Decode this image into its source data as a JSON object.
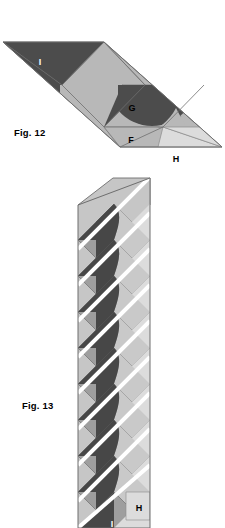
{
  "page": {
    "width": 225,
    "height": 528,
    "background": "#ffffff",
    "type": "geometric-figure-plate"
  },
  "figures": [
    {
      "id": "fig-12",
      "caption": "Fig. 12",
      "caption_position": {
        "x": 14,
        "y": 127
      },
      "description": "Flattened oblique band strip composed of triangular and lens-shaped tiles",
      "piece_labels": [
        {
          "text": "I",
          "x": 40,
          "y": 65,
          "tone": "dark"
        },
        {
          "text": "G",
          "x": 132,
          "y": 111,
          "tone": "light"
        },
        {
          "text": "F",
          "x": 131,
          "y": 143,
          "tone": "light"
        },
        {
          "text": "H",
          "x": 176,
          "y": 162,
          "tone": "light"
        }
      ]
    },
    {
      "id": "fig-13",
      "caption": "Fig. 13",
      "caption_position": {
        "x": 22,
        "y": 400
      },
      "description": "Vertical folded strip with repeating diagonal bands and S-curve lens tiles",
      "band_count": 9,
      "band_pitch": 36,
      "piece_labels": [
        {
          "text": "H",
          "x": 139,
          "y": 508,
          "tone": "light"
        },
        {
          "text": "I",
          "x": 112,
          "y": 525,
          "tone": "dark"
        }
      ]
    }
  ],
  "colors": {
    "dark_gray": "#4c4c4c",
    "mid_gray": "#8c8c8c",
    "light_gray": "#b4b4b4",
    "pale_gray": "#d5d5d5",
    "very_pale_gray": "#e6e6e6",
    "outline": "#6e6e6e",
    "white": "#ffffff",
    "text_black": "#000000"
  }
}
